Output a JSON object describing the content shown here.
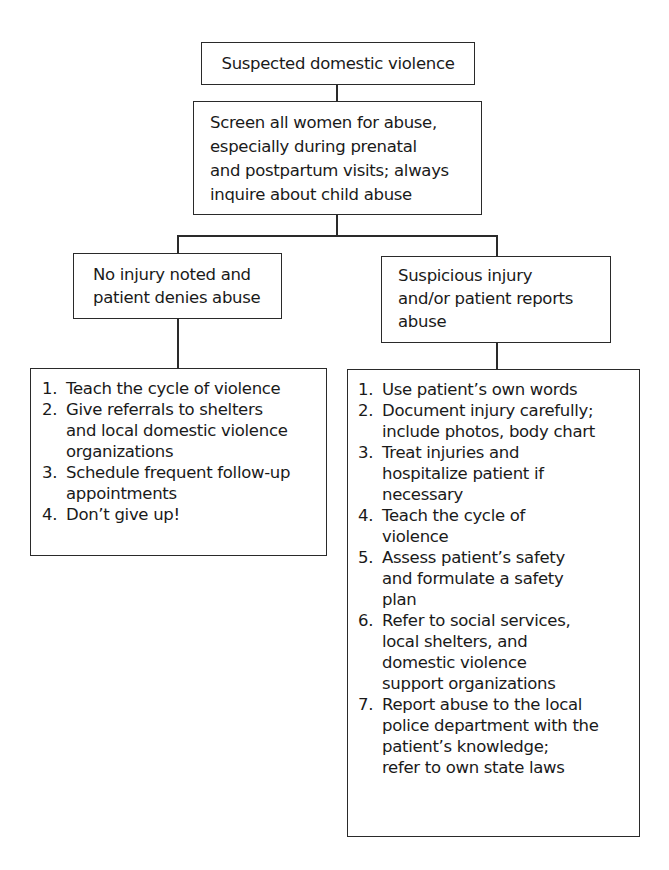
{
  "flowchart": {
    "root": {
      "label": "Suspected domestic violence"
    },
    "screen": {
      "lines": [
        "Screen all women for abuse,",
        "especially during prenatal",
        "and postpartum visits; always",
        "inquire about child abuse"
      ]
    },
    "left_branch": {
      "condition_lines": [
        "No injury noted and",
        "patient denies abuse"
      ],
      "actions": [
        {
          "num": "1.",
          "lines": [
            "Teach the cycle of violence"
          ]
        },
        {
          "num": "2.",
          "lines": [
            "Give referrals to shelters",
            "and local domestic violence",
            "organizations"
          ]
        },
        {
          "num": "3.",
          "lines": [
            "Schedule frequent follow-up",
            "appointments"
          ]
        },
        {
          "num": "4.",
          "lines": [
            "Don’t give up!"
          ]
        }
      ]
    },
    "right_branch": {
      "condition_lines": [
        "Suspicious injury",
        "and/or patient reports",
        "abuse"
      ],
      "actions": [
        {
          "num": "1.",
          "lines": [
            "Use patient’s own words"
          ]
        },
        {
          "num": "2.",
          "lines": [
            "Document injury carefully;",
            "include photos, body chart"
          ]
        },
        {
          "num": "3.",
          "lines": [
            "Treat injuries and",
            "hospitalize patient if",
            "necessary"
          ]
        },
        {
          "num": "4.",
          "lines": [
            "Teach the cycle of",
            "violence"
          ]
        },
        {
          "num": "5.",
          "lines": [
            "Assess patient’s safety",
            "and formulate a safety",
            "plan"
          ]
        },
        {
          "num": "6.",
          "lines": [
            "Refer to social services,",
            "local shelters, and",
            "domestic violence",
            "support organizations"
          ]
        },
        {
          "num": "7.",
          "lines": [
            "Report abuse to the local",
            "police department with the",
            "patient’s knowledge;",
            "refer to own state laws"
          ]
        }
      ]
    }
  }
}
